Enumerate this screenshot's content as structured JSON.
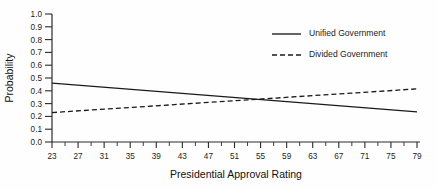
{
  "chart_data": {
    "type": "line",
    "title": "",
    "xlabel": "Presidential Approval Rating",
    "ylabel": "Probability",
    "xlim": [
      23,
      79
    ],
    "ylim": [
      0.0,
      1.0
    ],
    "grid": false,
    "legend_position": "upper right",
    "x_major_ticks": [
      23,
      27,
      31,
      35,
      39,
      43,
      47,
      51,
      55,
      59,
      63,
      67,
      71,
      75,
      79
    ],
    "x_minor_ticks": [
      25,
      29,
      33,
      37,
      41,
      45,
      49,
      53,
      57,
      61,
      65,
      69,
      73,
      77
    ],
    "y_ticks": [
      0.0,
      0.1,
      0.2,
      0.3,
      0.4,
      0.5,
      0.6,
      0.7,
      0.8,
      0.9,
      1.0
    ],
    "y_tick_labels": [
      "0.0",
      "0.1",
      "0.2",
      "0.3",
      "0.4",
      "0.5",
      "0.6",
      "0.7",
      "0.8",
      "0.9",
      "1.0"
    ],
    "x_tick_labels": [
      "23",
      "27",
      "31",
      "35",
      "39",
      "43",
      "47",
      "51",
      "55",
      "59",
      "63",
      "67",
      "71",
      "75",
      "79"
    ],
    "series": [
      {
        "name": "Unified Government",
        "style": "solid",
        "color": "#1a1a1a",
        "x": [
          23,
          79
        ],
        "values": [
          0.46,
          0.235
        ]
      },
      {
        "name": "Divided Government",
        "style": "dashed",
        "color": "#1a1a1a",
        "x": [
          23,
          79
        ],
        "values": [
          0.23,
          0.415
        ]
      }
    ]
  },
  "legend": {
    "items": [
      {
        "label": "Unified Government",
        "style": "solid"
      },
      {
        "label": "Divided Government",
        "style": "dashed"
      }
    ]
  },
  "axes": {
    "x_title": "Presidential Approval Rating",
    "y_title": "Probability"
  }
}
